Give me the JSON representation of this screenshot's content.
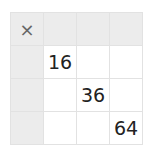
{
  "table": {
    "operator": "×",
    "header_row": [
      "",
      "",
      ""
    ],
    "header_col": [
      "",
      "",
      ""
    ],
    "cells": [
      [
        "16",
        "",
        ""
      ],
      [
        "",
        "36",
        ""
      ],
      [
        "",
        "",
        "64"
      ]
    ]
  }
}
